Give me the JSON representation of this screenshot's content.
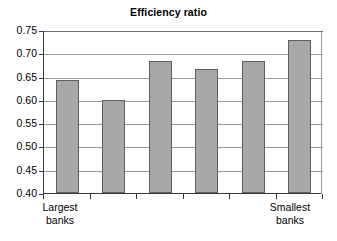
{
  "chart_data": {
    "type": "bar",
    "title": "Efficiency ratio",
    "xlabel": "",
    "ylabel": "",
    "categories": [
      "1",
      "2",
      "3",
      "4",
      "5",
      "6"
    ],
    "values": [
      0.642,
      0.599,
      0.683,
      0.666,
      0.684,
      0.728
    ],
    "ylim": [
      0.4,
      0.75
    ],
    "ytick_labels": [
      "0.75",
      "0.70",
      "0.65",
      "0.60",
      "0.55",
      "0.50",
      "0.45",
      "0.40"
    ],
    "ytick_values": [
      0.75,
      0.7,
      0.65,
      0.6,
      0.55,
      0.5,
      0.45,
      0.4
    ],
    "grid": true,
    "legend": false,
    "bar_color": "#a8a8a8",
    "bar_border_color": "#5f5f5f",
    "axis_color": "#3a3a3a",
    "gridline_color": "#9a9a9a",
    "background": "#ffffff",
    "annotations": [
      {
        "text_line1": "Largest",
        "text_line2": "banks",
        "category_index": 0
      },
      {
        "text_line1": "Smallest",
        "text_line2": "banks",
        "category_index": 5
      }
    ]
  },
  "axis": {
    "x_left_label": {
      "line1": "Largest",
      "line2": "banks"
    },
    "x_right_label": {
      "line1": "Smallest",
      "line2": "banks"
    }
  }
}
